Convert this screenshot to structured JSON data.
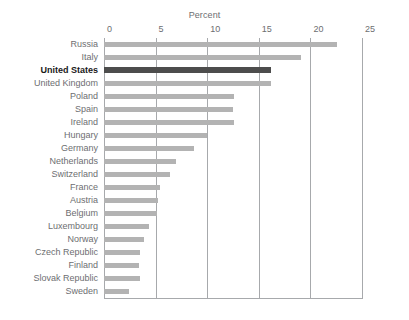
{
  "chart_data": {
    "type": "bar",
    "orientation": "horizontal",
    "title": "",
    "xlabel": "Percent",
    "ylabel": "",
    "xlim": [
      0,
      25
    ],
    "xticks": [
      0,
      5,
      10,
      15,
      20,
      25
    ],
    "xtick_labels": [
      "0",
      "5",
      "10",
      "15",
      "20",
      "25"
    ],
    "grid": true,
    "legend": false,
    "categories": [
      "Russia",
      "Italy",
      "United States",
      "United Kingdom",
      "Poland",
      "Spain",
      "Ireland",
      "Hungary",
      "Germany",
      "Netherlands",
      "Switzerland",
      "France",
      "Austria",
      "Belgium",
      "Luxembourg",
      "Norway",
      "Czech Republic",
      "Finland",
      "Slovak Republic",
      "Sweden"
    ],
    "values": [
      22.6,
      19.1,
      16.2,
      16.2,
      12.6,
      12.5,
      12.6,
      10.0,
      8.7,
      7.0,
      6.4,
      5.4,
      5.2,
      5.1,
      4.4,
      3.9,
      3.5,
      3.4,
      3.5,
      2.4
    ],
    "highlight_category": "United States",
    "colors": {
      "bar": "#b3b3b3",
      "bar_highlight": "#4d4d4d",
      "gridline": "#a7a9ac",
      "text": "#6d6e71",
      "text_highlight": "#1a1a1a",
      "background": "#ffffff"
    }
  }
}
